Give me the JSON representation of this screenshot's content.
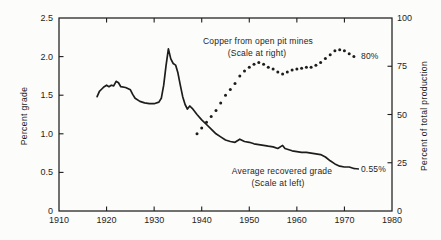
{
  "figure": {
    "background": "#fcfcfa",
    "ink_color": "#1d1d1d"
  },
  "chart_data": {
    "type": "line",
    "title": "",
    "grid": "off",
    "x": {
      "label": "",
      "range": [
        1910,
        1980
      ],
      "ticks": [
        {
          "v": 1910,
          "label": "1910"
        },
        {
          "v": 1920,
          "label": "1920"
        },
        {
          "v": 1930,
          "label": "1930"
        },
        {
          "v": 1940,
          "label": "1940"
        },
        {
          "v": 1950,
          "label": "1950"
        },
        {
          "v": 1960,
          "label": "1960"
        },
        {
          "v": 1970,
          "label": "1970"
        },
        {
          "v": 1980,
          "label": "1980"
        }
      ]
    },
    "y_left": {
      "label": "Percent grade",
      "range": [
        0,
        2.5
      ],
      "ticks": [
        {
          "v": 0,
          "label": "0"
        },
        {
          "v": 0.5,
          "label": "0.5"
        },
        {
          "v": 1.0,
          "label": "1.0"
        },
        {
          "v": 1.5,
          "label": "1.5"
        },
        {
          "v": 2.0,
          "label": "2.0"
        },
        {
          "v": 2.5,
          "label": "2.5"
        }
      ]
    },
    "y_right": {
      "label": "Percent of total production",
      "range": [
        0,
        100
      ],
      "ticks": [
        {
          "v": 0,
          "label": "0"
        },
        {
          "v": 25,
          "label": "25"
        },
        {
          "v": 50,
          "label": "50"
        },
        {
          "v": 75,
          "label": "75"
        },
        {
          "v": 100,
          "label": "100"
        }
      ]
    },
    "series": [
      {
        "id": "avg-recovered-grade",
        "name": "Average recovered grade",
        "axis": "left",
        "style": "line",
        "label_lines": [
          "Average recovered grade",
          "(Scale at left)"
        ],
        "end_label": "0.55%",
        "points": [
          [
            1918,
            1.48
          ],
          [
            1918.5,
            1.55
          ],
          [
            1919,
            1.58
          ],
          [
            1919.5,
            1.61
          ],
          [
            1920,
            1.63
          ],
          [
            1920.5,
            1.61
          ],
          [
            1921,
            1.63
          ],
          [
            1921.5,
            1.62
          ],
          [
            1922,
            1.68
          ],
          [
            1922.5,
            1.66
          ],
          [
            1923,
            1.61
          ],
          [
            1924,
            1.6
          ],
          [
            1925,
            1.57
          ],
          [
            1925.5,
            1.51
          ],
          [
            1926,
            1.46
          ],
          [
            1927,
            1.42
          ],
          [
            1928,
            1.4
          ],
          [
            1929,
            1.39
          ],
          [
            1930,
            1.39
          ],
          [
            1931,
            1.41
          ],
          [
            1931.5,
            1.46
          ],
          [
            1932,
            1.63
          ],
          [
            1932.5,
            1.88
          ],
          [
            1933,
            2.1
          ],
          [
            1933.5,
            1.97
          ],
          [
            1934,
            1.91
          ],
          [
            1934.5,
            1.89
          ],
          [
            1935,
            1.79
          ],
          [
            1935.5,
            1.63
          ],
          [
            1936,
            1.48
          ],
          [
            1936.5,
            1.38
          ],
          [
            1937,
            1.32
          ],
          [
            1937.5,
            1.36
          ],
          [
            1938,
            1.33
          ],
          [
            1939,
            1.25
          ],
          [
            1940,
            1.18
          ],
          [
            1941,
            1.12
          ],
          [
            1942,
            1.06
          ],
          [
            1943,
            1.0
          ],
          [
            1944,
            0.96
          ],
          [
            1945,
            0.92
          ],
          [
            1946,
            0.9
          ],
          [
            1947,
            0.89
          ],
          [
            1948,
            0.93
          ],
          [
            1949,
            0.9
          ],
          [
            1950,
            0.89
          ],
          [
            1951,
            0.87
          ],
          [
            1952,
            0.86
          ],
          [
            1953,
            0.85
          ],
          [
            1954,
            0.84
          ],
          [
            1955,
            0.83
          ],
          [
            1956,
            0.81
          ],
          [
            1957,
            0.85
          ],
          [
            1957.5,
            0.81
          ],
          [
            1958,
            0.8
          ],
          [
            1959,
            0.78
          ],
          [
            1960,
            0.77
          ],
          [
            1961,
            0.76
          ],
          [
            1962,
            0.76
          ],
          [
            1963,
            0.75
          ],
          [
            1964,
            0.74
          ],
          [
            1965,
            0.73
          ],
          [
            1966,
            0.7
          ],
          [
            1967,
            0.65
          ],
          [
            1968,
            0.61
          ],
          [
            1969,
            0.58
          ],
          [
            1970,
            0.57
          ],
          [
            1971,
            0.57
          ],
          [
            1972,
            0.55
          ]
        ]
      },
      {
        "id": "copper-open-pit",
        "name": "Copper from open pit mines",
        "axis": "right",
        "style": "dots",
        "label_lines": [
          "Copper from open pit mines",
          "(Scale at right)"
        ],
        "end_label": "80%",
        "points": [
          [
            1939,
            40
          ],
          [
            1940,
            43
          ],
          [
            1941,
            46
          ],
          [
            1942,
            49
          ],
          [
            1943,
            52
          ],
          [
            1944,
            56
          ],
          [
            1945,
            60
          ],
          [
            1946,
            63
          ],
          [
            1947,
            66
          ],
          [
            1948,
            70
          ],
          [
            1949,
            72.5
          ],
          [
            1950,
            74.5
          ],
          [
            1951,
            76
          ],
          [
            1952,
            77
          ],
          [
            1953,
            76
          ],
          [
            1954,
            74.5
          ],
          [
            1955,
            73.5
          ],
          [
            1956,
            72
          ],
          [
            1957,
            71
          ],
          [
            1958,
            72
          ],
          [
            1959,
            73
          ],
          [
            1960,
            73.5
          ],
          [
            1961,
            74
          ],
          [
            1962,
            74.5
          ],
          [
            1963,
            74.5
          ],
          [
            1964,
            75.5
          ],
          [
            1965,
            77
          ],
          [
            1966,
            79
          ],
          [
            1967,
            81
          ],
          [
            1968,
            83
          ],
          [
            1969,
            83.5
          ],
          [
            1970,
            83
          ],
          [
            1971,
            81.5
          ],
          [
            1972,
            80
          ]
        ]
      }
    ]
  }
}
